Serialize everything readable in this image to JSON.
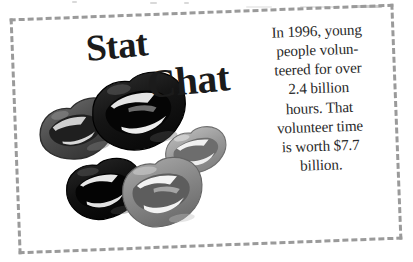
{
  "page": {
    "background_color": "#ffffff",
    "width": 413,
    "height": 262
  },
  "frame": {
    "style": "dashed",
    "color": "#9a9a9a",
    "thickness_px": 3,
    "rotation_deg": -2.2
  },
  "title": {
    "line1": "Stat",
    "line2": "Chat",
    "color": "#1b1b1b"
  },
  "stat_text": {
    "lines": [
      "In 1996, young",
      "people volun-",
      "teered for over",
      "2.4 billion",
      "hours. That",
      "volunteer time",
      "is worth $7.7",
      "billion."
    ],
    "full_text": "In 1996, young people volunteered for over 2.4 billion hours. That volunteer time is worth $7.7 billion.",
    "color": "#2a2a2a",
    "alignment": "center"
  },
  "graphics": {
    "description": "cluster of five stylized lips illustrations",
    "lips": [
      {
        "name": "lips-dark-gray-open-left",
        "shade": "#4f4f4f",
        "state": "open"
      },
      {
        "name": "lips-black-open-large",
        "shade": "#141414",
        "state": "open"
      },
      {
        "name": "lips-light-gray-closed-right",
        "shade": "#9d9d9d",
        "state": "closed"
      },
      {
        "name": "lips-black-closed-bottom",
        "shade": "#111111",
        "state": "closed"
      },
      {
        "name": "lips-medium-gray-open-bottom",
        "shade": "#8a8a8a",
        "state": "open"
      }
    ]
  }
}
